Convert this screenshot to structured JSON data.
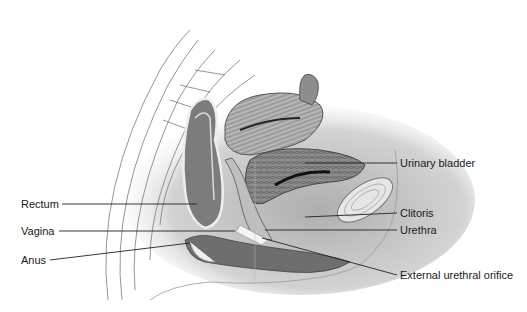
{
  "diagram": {
    "labels": {
      "left": [
        {
          "id": "rectum",
          "text": "Rectum"
        },
        {
          "id": "vagina",
          "text": "Vagina"
        },
        {
          "id": "anus",
          "text": "Anus"
        }
      ],
      "right": [
        {
          "id": "urinary_bladder",
          "text": "Urinary bladder"
        },
        {
          "id": "clitoris",
          "text": "Clitoris"
        },
        {
          "id": "urethra",
          "text": "Urethra"
        },
        {
          "id": "external_urethral_orifice",
          "text": "External urethral orifice"
        }
      ]
    },
    "colors": {
      "background": "#ffffff",
      "ink": "#1a1a1a",
      "tissue_dark": "#6e6e6e",
      "tissue_mid": "#a8a8a8",
      "tissue_light": "#d8d8d8"
    }
  }
}
